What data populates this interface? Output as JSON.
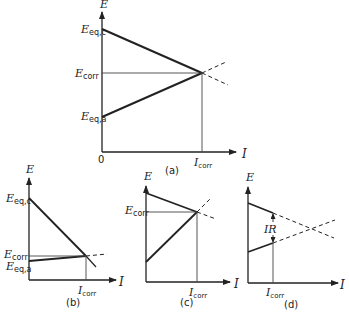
{
  "panels": {
    "a": {
      "caption": "(a)",
      "y_axis": "E",
      "x_axis": "I",
      "origin": "0",
      "e_eq_c": {
        "main": "E",
        "sub": "eq,c"
      },
      "e_corr": {
        "main": "E",
        "sub": "corr"
      },
      "e_eq_a": {
        "main": "E",
        "sub": "eq,a"
      },
      "i_corr": {
        "main": "I",
        "sub": "corr"
      }
    },
    "b": {
      "caption": "(b)",
      "y_axis": "E",
      "x_axis": "I",
      "e_eq_c": {
        "main": "E",
        "sub": "eq,c"
      },
      "e_corr": {
        "main": "E",
        "sub": "corr"
      },
      "e_eq_a": {
        "main": "E",
        "sub": "eq,a"
      },
      "i_corr": {
        "main": "I",
        "sub": "corr"
      }
    },
    "c": {
      "caption": "(c)",
      "y_axis": "E",
      "x_axis": "I",
      "e_corr": {
        "main": "E",
        "sub": "corr"
      },
      "i_corr": {
        "main": "I",
        "sub": "corr"
      }
    },
    "d": {
      "caption": "(d)",
      "y_axis": "E",
      "x_axis": "I",
      "ir": "IR",
      "i_corr": {
        "main": "I",
        "sub": "corr"
      }
    }
  }
}
